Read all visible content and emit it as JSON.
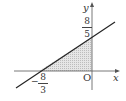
{
  "diagram": {
    "axes": {
      "x_label": "x",
      "y_label": "y",
      "origin_label": "O"
    },
    "line": {
      "description": "straight line through (-8/3, 0) and (0, 8/5)"
    },
    "x_intercept": {
      "sign": "−",
      "numerator": "8",
      "denominator": "3"
    },
    "y_intercept": {
      "numerator": "8",
      "denominator": "5"
    },
    "shaded_region": "triangle bounded by line, x-axis and y-axis",
    "colors": {
      "axis": "#555555",
      "line": "#222222",
      "shade": "#d9d9d9"
    }
  }
}
